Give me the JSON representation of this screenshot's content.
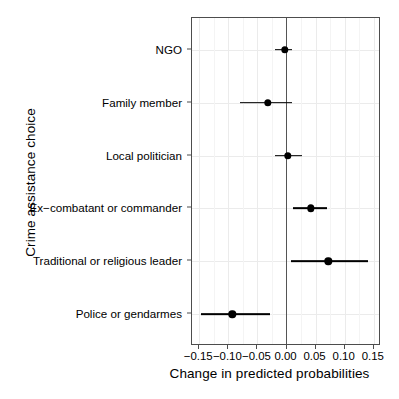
{
  "chart_data": {
    "type": "scatter",
    "subtype": "coefficient-dot-plot-with-error-bars",
    "title": "",
    "xlabel": "Change in predicted probabilities",
    "ylabel": "Crime assistance choice",
    "xlim": [
      -0.1625,
      0.1625
    ],
    "xticks": [
      -0.15,
      -0.1,
      -0.05,
      0.0,
      0.05,
      0.1,
      0.15
    ],
    "xticklabels": [
      "−0.15",
      "−0.10",
      "−0.05",
      "0.00",
      "0.05",
      "0.10",
      "0.15"
    ],
    "minor_xticks": [
      -0.125,
      -0.075,
      -0.025,
      0.025,
      0.075,
      0.125
    ],
    "grid": true,
    "reference_line": 0.0,
    "categories": [
      "NGO",
      "Family member",
      "Local politician",
      "Ex−combatant or commander",
      "Traditional or religious leader",
      "Police or gendarmes"
    ],
    "values": [
      -0.003,
      -0.032,
      0.002,
      0.042,
      0.072,
      -0.093
    ],
    "ci_low": [
      -0.019,
      -0.08,
      -0.02,
      0.012,
      0.008,
      -0.147
    ],
    "ci_high": [
      0.01,
      0.01,
      0.027,
      0.07,
      0.14,
      -0.028
    ],
    "points": [
      {
        "category": "NGO",
        "estimate": -0.003,
        "ci_low": -0.019,
        "ci_high": 0.01
      },
      {
        "category": "Family member",
        "estimate": -0.032,
        "ci_low": -0.08,
        "ci_high": 0.01
      },
      {
        "category": "Local politician",
        "estimate": 0.002,
        "ci_low": -0.02,
        "ci_high": 0.027
      },
      {
        "category": "Ex−combatant or commander",
        "estimate": 0.042,
        "ci_low": 0.012,
        "ci_high": 0.07
      },
      {
        "category": "Traditional or religious leader",
        "estimate": 0.072,
        "ci_low": 0.008,
        "ci_high": 0.14
      },
      {
        "category": "Police or gendarmes",
        "estimate": -0.093,
        "ci_low": -0.147,
        "ci_high": -0.028
      }
    ],
    "colors": {
      "point": "#000000",
      "error_bar": "#000000",
      "panel_border": "#4d4d4d",
      "grid_major": "#ebebeb",
      "grid_minor": "#f4f4f4",
      "zero_line": "#555555",
      "background": "#ffffff"
    }
  }
}
